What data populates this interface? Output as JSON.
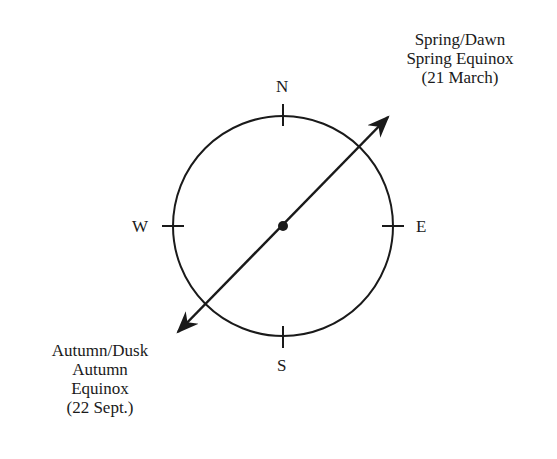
{
  "diagram": {
    "type": "compass-equinox",
    "directions": {
      "north": "N",
      "south": "S",
      "east": "E",
      "west": "W"
    },
    "ne_label": {
      "line1": "Spring/Dawn",
      "line2": "Spring Equinox",
      "line3": "(21 March)"
    },
    "sw_label": {
      "line1": "Autumn/Dusk",
      "line2": "Autumn",
      "line3": "Equinox",
      "line4": "(22 Sept.)"
    }
  }
}
